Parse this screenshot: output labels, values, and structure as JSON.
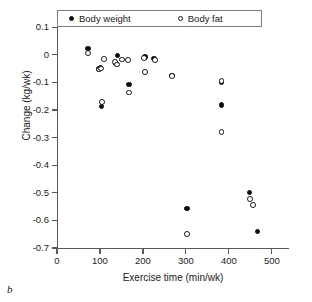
{
  "panel_label": "b",
  "legend": {
    "position": "top-inside",
    "entries": [
      {
        "label": "Body weight",
        "marker": "filled-circle-icon"
      },
      {
        "label": "Body fat",
        "marker": "open-circle-icon"
      }
    ]
  },
  "axes": {
    "x": {
      "label": "Exercise time (min/wk)",
      "ticks": [
        0,
        100,
        200,
        300,
        400,
        500
      ],
      "tick_labels": [
        "0",
        "100",
        "200",
        "300",
        "400",
        "500"
      ],
      "min": 0,
      "max": 540
    },
    "y": {
      "label": "Change (kg/wk)",
      "ticks": [
        0.1,
        0,
        -0.1,
        -0.2,
        -0.3,
        -0.4,
        -0.5,
        -0.6,
        -0.7
      ],
      "tick_labels": [
        "0.1",
        "0",
        "-0.1",
        "-0.2",
        "-0.3",
        "-0.4",
        "-0.5",
        "-0.6",
        "-0.7"
      ],
      "min": -0.7,
      "max": 0.155
    }
  },
  "chart_data": {
    "type": "scatter",
    "title": "",
    "xlabel": "Exercise time (min/wk)",
    "ylabel": "Change (kg/wk)",
    "xlim": [
      0,
      540
    ],
    "ylim": [
      -0.7,
      0.155
    ],
    "grid": false,
    "legend_position": "top-inside",
    "series": [
      {
        "name": "Body weight",
        "marker": "filled-circle",
        "points": [
          {
            "x": 72,
            "y": 0.022
          },
          {
            "x": 96,
            "y": -0.052
          },
          {
            "x": 101,
            "y": -0.048
          },
          {
            "x": 104,
            "y": -0.188
          },
          {
            "x": 137,
            "y": -0.032
          },
          {
            "x": 141,
            "y": -0.002
          },
          {
            "x": 168,
            "y": -0.108
          },
          {
            "x": 205,
            "y": -0.008
          },
          {
            "x": 226,
            "y": -0.014
          },
          {
            "x": 268,
            "y": -0.074
          },
          {
            "x": 303,
            "y": -0.556
          },
          {
            "x": 383,
            "y": -0.1
          },
          {
            "x": 383,
            "y": -0.182
          },
          {
            "x": 448,
            "y": -0.499
          },
          {
            "x": 466,
            "y": -0.64
          }
        ]
      },
      {
        "name": "Body fat",
        "marker": "open-circle",
        "points": [
          {
            "x": 73,
            "y": 0.006
          },
          {
            "x": 97,
            "y": -0.053
          },
          {
            "x": 103,
            "y": -0.05
          },
          {
            "x": 104,
            "y": -0.172
          },
          {
            "x": 110,
            "y": -0.014
          },
          {
            "x": 135,
            "y": -0.025
          },
          {
            "x": 140,
            "y": -0.035
          },
          {
            "x": 152,
            "y": -0.017
          },
          {
            "x": 166,
            "y": -0.018
          },
          {
            "x": 168,
            "y": -0.137
          },
          {
            "x": 203,
            "y": -0.012
          },
          {
            "x": 205,
            "y": -0.063
          },
          {
            "x": 228,
            "y": -0.018
          },
          {
            "x": 268,
            "y": -0.078
          },
          {
            "x": 303,
            "y": -0.65
          },
          {
            "x": 383,
            "y": -0.094
          },
          {
            "x": 383,
            "y": -0.279
          },
          {
            "x": 449,
            "y": -0.522
          },
          {
            "x": 456,
            "y": -0.545
          }
        ]
      }
    ]
  }
}
